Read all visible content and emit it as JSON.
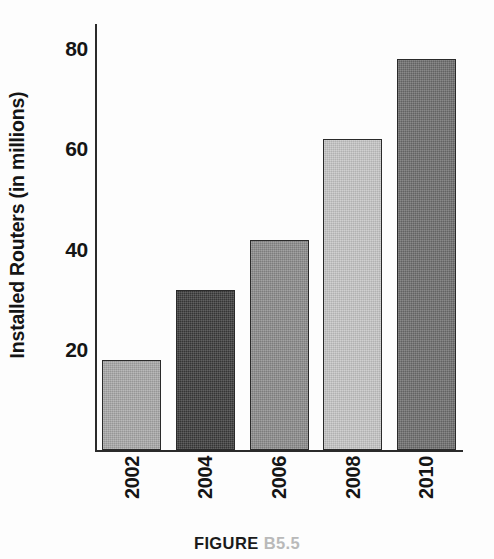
{
  "figure": {
    "caption_label": "FIGURE",
    "caption_number": "B5.5",
    "caption_label_color": "#1b1b1b",
    "caption_number_color": "#b9b9b9"
  },
  "chart_data": {
    "type": "bar",
    "title": "",
    "xlabel": "",
    "ylabel": "Installed Routers (in millions)",
    "categories": [
      "2002",
      "2004",
      "2006",
      "2008",
      "2010"
    ],
    "values": [
      18,
      32,
      42,
      62,
      78
    ],
    "ylim": [
      0,
      85
    ],
    "yticks": [
      20,
      40,
      60,
      80
    ],
    "ytick_labels": [
      "20",
      "40",
      "60",
      "80"
    ],
    "grid": false,
    "legend": false,
    "legend_position": "none",
    "bar_colors": [
      "#a8a8a8",
      "#3b3b3b",
      "#8b8b8b",
      "#c6c6c6",
      "#6e6e6e"
    ],
    "bar_outline_color": "#2a2a2a",
    "axis_color": "#2b2b2b",
    "series": [
      {
        "name": "Installed Routers",
        "values": [
          18,
          32,
          42,
          62,
          78
        ]
      }
    ],
    "points": [
      {
        "category": "2002",
        "value": 18,
        "color": "#a8a8a8"
      },
      {
        "category": "2004",
        "value": 32,
        "color": "#3b3b3b"
      },
      {
        "category": "2006",
        "value": 42,
        "color": "#8b8b8b"
      },
      {
        "category": "2008",
        "value": 62,
        "color": "#c6c6c6"
      },
      {
        "category": "2010",
        "value": 78,
        "color": "#6e6e6e"
      }
    ]
  }
}
